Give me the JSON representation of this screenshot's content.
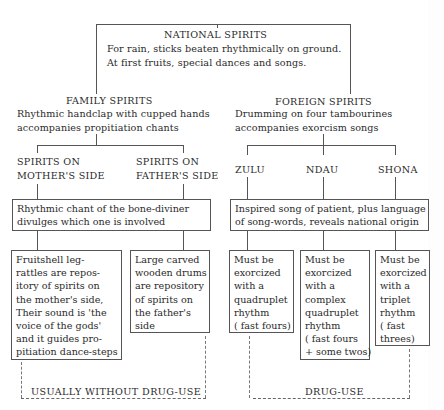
{
  "national": {
    "title": "NATIONAL SPIRITS",
    "line1": "For rain, sticks beaten rhythmically on ground.",
    "line2": "At first fruits, special dances and songs."
  },
  "family": {
    "title": "FAMILY SPIRITS",
    "line1": "Rhythmic handclap with cupped hands",
    "line2": "accompanies propitiation chants",
    "mother": {
      "line1": "SPIRITS ON",
      "line2": "MOTHER'S SIDE"
    },
    "father": {
      "line1": "SPIRITS ON",
      "line2": "FATHER'S SIDE"
    },
    "diviner_box": "Rhythmic chant of the bone-diviner\ndivulges which one is involved",
    "mother_box": "Fruitshell leg-\nrattles are repos-\nitory of spirits on\nthe mother's side,\nTheir sound is 'the\nvoice of the gods'\nand it guides pro-\npitiation dance-steps",
    "father_box": "Large carved\nwooden drums\nare repository\nof spirits on\nthe father's\nside",
    "drug_label": "USUALLY WITHOUT DRUG-USE"
  },
  "foreign": {
    "title": "FOREIGN SPIRITS",
    "line1": "Drumming on four tambourines",
    "line2": "accompanies exorcism songs",
    "groups": [
      {
        "name": "ZULU",
        "box": "Must be\nexorcized\nwith a\nquadruplet\nrhythm\n( fast fours)"
      },
      {
        "name": "NDAU",
        "box": "Must be\nexorcized\nwith a\ncomplex\nquadruplet\nrhythm\n( fast fours\n+ some twos)"
      },
      {
        "name": "SHONA",
        "box": "Must be\nexorcized\nwith a\ntriplet\nrhythm\n( fast\nthrees)"
      }
    ],
    "song_box": "Inspired song of patient, plus language\nof song-words, reveals national origin",
    "drug_label": "DRUG-USE"
  }
}
